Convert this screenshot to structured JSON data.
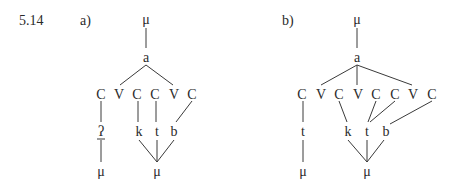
{
  "example_number": "5.14",
  "panels": [
    {
      "label": "a)",
      "top_mora": "μ",
      "vowel": "a",
      "skeleton": [
        "C",
        "V",
        "C",
        "C",
        "V",
        "C"
      ],
      "segments": [
        "ʔ",
        "k",
        "t",
        "b"
      ],
      "bottom_moras": [
        "μ",
        "μ"
      ]
    },
    {
      "label": "b)",
      "top_mora": "μ",
      "vowel": "a",
      "skeleton": [
        "C",
        "V",
        "C",
        "V",
        "C",
        "C",
        "V",
        "C"
      ],
      "segments": [
        "t",
        "k",
        "t",
        "b"
      ],
      "bottom_moras": [
        "μ",
        "μ"
      ]
    }
  ]
}
